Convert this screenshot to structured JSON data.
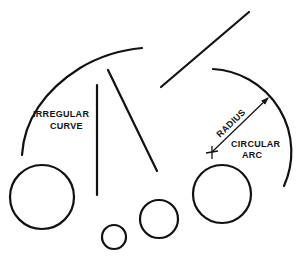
{
  "diagram": {
    "stroke_color": "#111111",
    "background": "#ffffff",
    "labels": {
      "irregular_curve_line1": "IRREGULAR",
      "irregular_curve_line2": "CURVE",
      "radius": "RADIUS",
      "circular_arc_line1": "CIRCULAR",
      "circular_arc_line2": "ARC"
    },
    "elements": [
      {
        "type": "irregular-curve",
        "points": [
          [
            22,
            155
          ],
          [
            38,
            105
          ],
          [
            80,
            66
          ],
          [
            142,
            48
          ]
        ]
      },
      {
        "type": "line",
        "name": "vertical-line",
        "from": [
          97,
          85
        ],
        "to": [
          97,
          195
        ]
      },
      {
        "type": "line",
        "name": "diagonal-line",
        "from": [
          108,
          70
        ],
        "to": [
          157,
          171
        ]
      },
      {
        "type": "line",
        "name": "upper-diagonal-line",
        "from": [
          161,
          87
        ],
        "to": [
          249,
          12
        ]
      },
      {
        "type": "circular-arc",
        "center": [
          212,
          152
        ],
        "from": [
          213,
          69
        ],
        "to": [
          284,
          186
        ]
      },
      {
        "type": "radius-arrow",
        "from": [
          212,
          152
        ],
        "to": [
          269,
          97
        ]
      },
      {
        "type": "center-mark",
        "at": [
          212,
          152
        ]
      },
      {
        "type": "circle",
        "center": [
          42,
          197
        ],
        "r": 32
      },
      {
        "type": "circle",
        "center": [
          114,
          237
        ],
        "r": 12
      },
      {
        "type": "circle",
        "center": [
          159,
          219
        ],
        "r": 19
      },
      {
        "type": "circle",
        "center": [
          222,
          194
        ],
        "r": 29
      }
    ]
  }
}
